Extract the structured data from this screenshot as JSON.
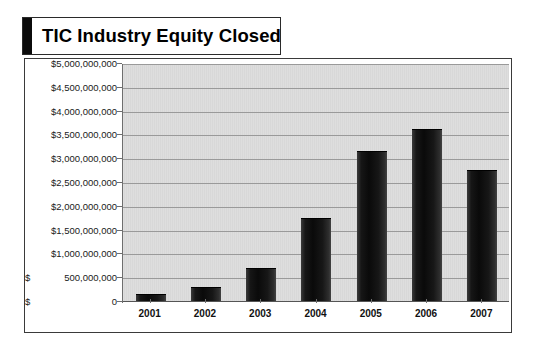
{
  "title": {
    "text": "TIC Industry Equity Closed"
  },
  "chart_data": {
    "type": "bar",
    "title": "TIC Industry Equity Closed",
    "xlabel": "",
    "ylabel": "",
    "categories": [
      "2001",
      "2002",
      "2003",
      "2004",
      "2005",
      "2006",
      "2007"
    ],
    "values": [
      150000000,
      290000000,
      690000000,
      1740000000,
      3150000000,
      3620000000,
      2750000000
    ],
    "ylim": [
      0,
      5000000000
    ],
    "ytick_values": [
      0,
      500000000,
      1000000000,
      1500000000,
      2000000000,
      2500000000,
      3000000000,
      3500000000,
      4000000000,
      4500000000,
      5000000000
    ],
    "ytick_labels": [
      {
        "currency": "$",
        "number": "0"
      },
      {
        "currency": "$",
        "number": "500,000,000"
      },
      {
        "currency": "$1,000,000,000",
        "number": ""
      },
      {
        "currency": "$1,500,000,000",
        "number": ""
      },
      {
        "currency": "$2,000,000,000",
        "number": ""
      },
      {
        "currency": "$2,500,000,000",
        "number": ""
      },
      {
        "currency": "$3,000,000,000",
        "number": ""
      },
      {
        "currency": "$3,500,000,000",
        "number": ""
      },
      {
        "currency": "$4,000,000,000",
        "number": ""
      },
      {
        "currency": "$4,500,000,000",
        "number": ""
      },
      {
        "currency": "$5,000,000,000",
        "number": ""
      }
    ],
    "grid": true,
    "legend": false,
    "bar_color": "#0d0d0d",
    "plot_background": "#dcdcdc",
    "gridline_color": "#9a9a9a"
  },
  "ytick_labels_display": [
    "$5,000,000,000",
    "$4,500,000,000",
    "$4,000,000,000",
    "$3,500,000,000",
    "$3,000,000,000",
    "$2,500,000,000",
    "$2,000,000,000",
    "$1,500,000,000",
    "$1,000,000,000",
    "$   500,000,000",
    "$              0"
  ]
}
